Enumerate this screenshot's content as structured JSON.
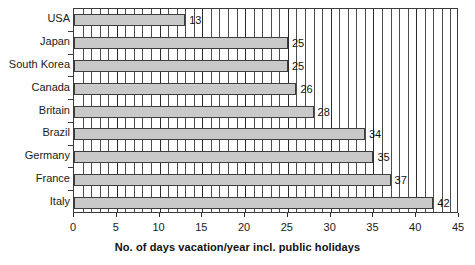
{
  "chart_data": {
    "type": "bar",
    "orientation": "horizontal",
    "title": "",
    "subtitle": "",
    "xlabel": "No. of days vacation/year incl. public holidays",
    "ylabel": "",
    "categories": [
      "USA",
      "Japan",
      "South Korea",
      "Canada",
      "Britain",
      "Brazil",
      "Germany",
      "France",
      "Italy"
    ],
    "values": [
      13,
      25,
      25,
      26,
      28,
      34,
      35,
      37,
      42
    ],
    "data_labels": [
      "13",
      "25",
      "25",
      "26",
      "28",
      "34",
      "35",
      "37",
      "42"
    ],
    "xlim": [
      0,
      45
    ],
    "xticks": [
      0,
      5,
      10,
      15,
      20,
      25,
      30,
      35,
      40,
      45
    ],
    "xtick_labels": [
      "0",
      "5",
      "10",
      "15",
      "20",
      "25",
      "30",
      "35",
      "40",
      "45"
    ],
    "minor_tick_step": 1,
    "grid": true,
    "grid_axis": "x",
    "legend": false,
    "legend_position": "none",
    "bar_color": "#c9c9c9",
    "bar_border_color": "#3d3d3d",
    "grid_color": "#4d4d4d",
    "axis_color": "#2b2b2b",
    "text_color": "#111111"
  }
}
